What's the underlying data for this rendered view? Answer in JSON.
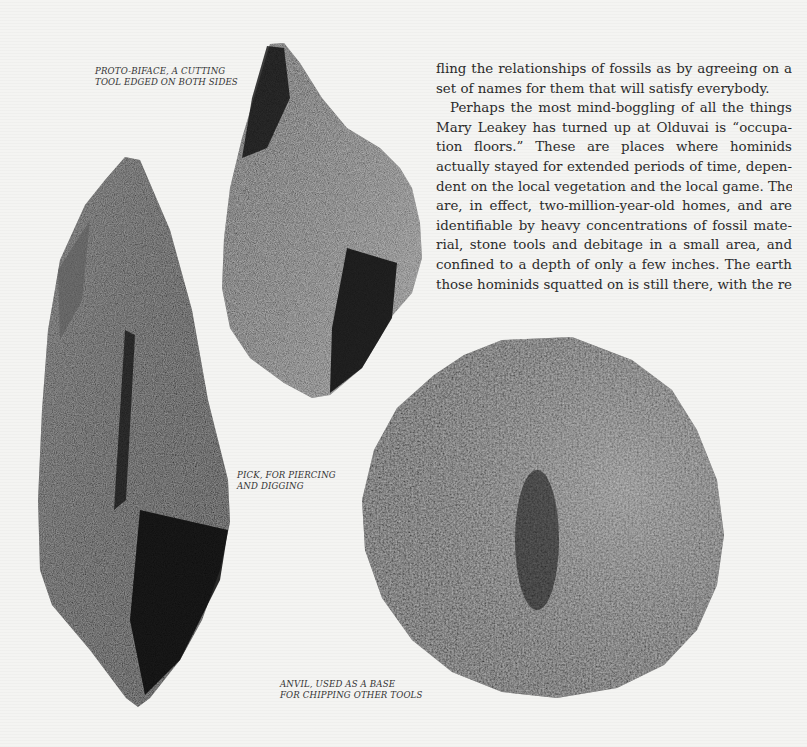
{
  "page": {
    "type": "book page",
    "background_color": "#f4f4f2"
  },
  "figures": [
    {
      "id": "proto-biface",
      "caption_lines": [
        "PROTO-BIFACE, A CUTTING",
        "TOOL EDGED ON BOTH SIDES"
      ],
      "icon": "stone-tool-photo"
    },
    {
      "id": "pick",
      "caption_lines": [
        "PICK, FOR PIERCING",
        "AND DIGGING"
      ],
      "icon": "stone-tool-photo"
    },
    {
      "id": "anvil",
      "caption_lines": [
        "ANVIL, USED AS A BASE",
        "FOR CHIPPING OTHER TOOLS"
      ],
      "icon": "stone-tool-photo"
    }
  ],
  "body_text": {
    "lines": [
      "fling the relationships of fossils as by agreeing on a",
      "set of names for them that will satisfy everybody.",
      "Perhaps the most mind-boggling of all the things",
      "Mary Leakey has turned up at Olduvai is “occupa-",
      "tion floors.” These are places where hominids",
      "actually stayed for extended periods of time, depen-",
      "dent on the local vegetation and the local game. They",
      "are, in effect, two-million-year-old homes, and are",
      "identifiable by heavy concentrations of fossil mate-",
      "rial, stone tools and debitage in a small area, and",
      "confined to a depth of only a few inches. The earth",
      "those hominids squatted on is still there, with the re-"
    ]
  }
}
